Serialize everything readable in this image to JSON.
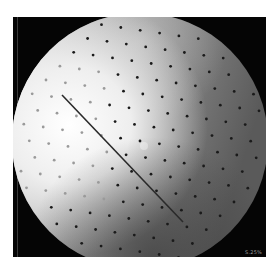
{
  "image": {
    "kind": "fluoroscopy",
    "description": "Circular fluoroscopic X-ray field with a calibration dot grid and a straight needle/guidewire",
    "corner_label": "S.25%",
    "colors": {
      "background": "#ffffff",
      "frame": "#050505",
      "bright_region": "#f4f4f4",
      "dark_region": "#4a4a4a",
      "dots": "#1a1a1a",
      "needle": "#2a2a2a"
    }
  }
}
